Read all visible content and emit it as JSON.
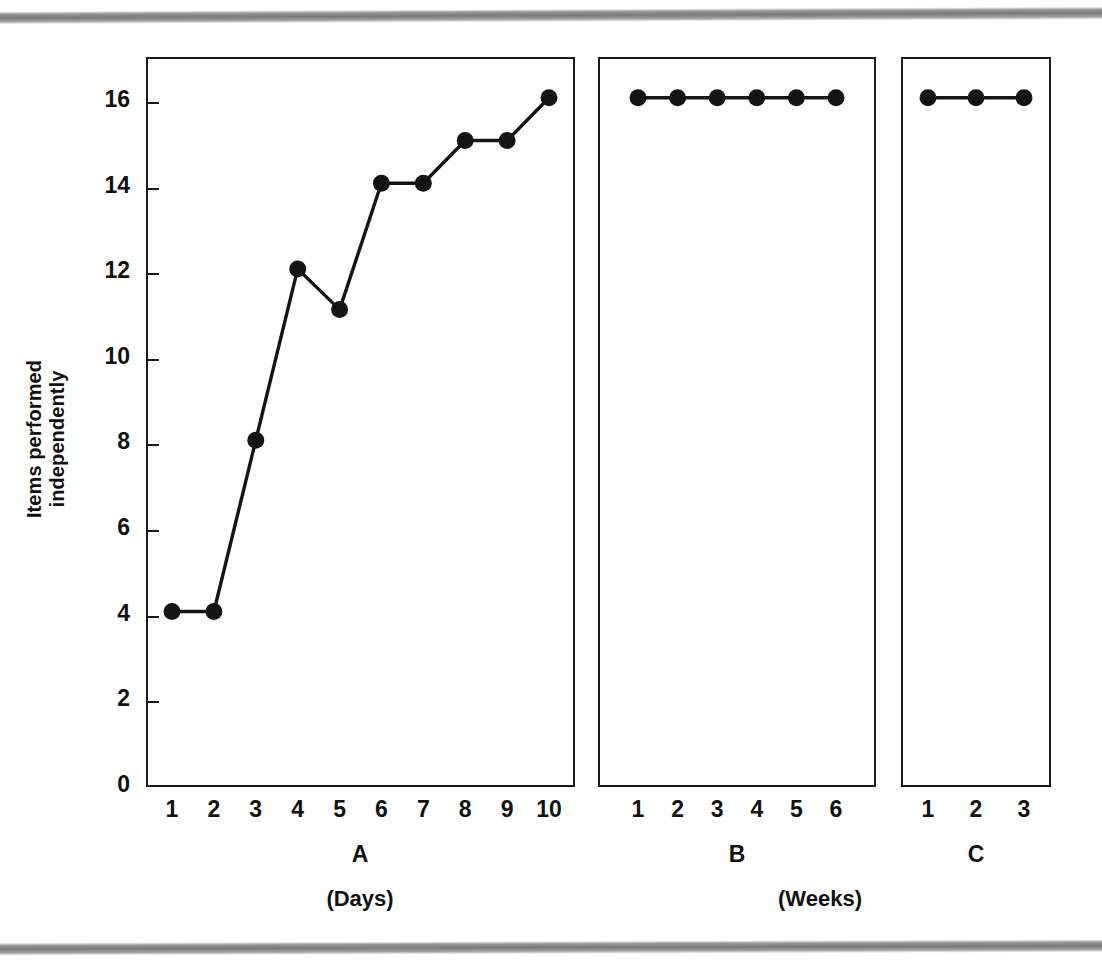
{
  "figure": {
    "background": "#ffffff",
    "ink_color": "#141414"
  },
  "axis": {
    "y_title": "Items performed independently",
    "y_ticks": [
      "0",
      "2",
      "4",
      "6",
      "8",
      "10",
      "12",
      "14",
      "16"
    ]
  },
  "panels": {
    "a": {
      "letter": "A",
      "unit": "(Days)",
      "x_ticks": [
        "1",
        "2",
        "3",
        "4",
        "5",
        "6",
        "7",
        "8",
        "9",
        "10"
      ]
    },
    "b": {
      "letter": "B",
      "unit": "(Weeks)",
      "x_ticks": [
        "1",
        "2",
        "3",
        "4",
        "5",
        "6"
      ]
    },
    "c": {
      "letter": "C",
      "unit": "",
      "x_ticks": [
        "1",
        "2",
        "3"
      ]
    }
  },
  "chart_data": {
    "type": "line",
    "title": "",
    "xlabel": "",
    "ylabel": "Items performed independently",
    "ylim": [
      0,
      17
    ],
    "grid": false,
    "legend": "none",
    "marker": "filled-circle",
    "panels": [
      {
        "name": "A",
        "unit": "(Days)",
        "x": [
          1,
          2,
          3,
          4,
          5,
          6,
          7,
          8,
          9,
          10
        ],
        "y": [
          4.1,
          4.1,
          8.1,
          12.1,
          11.15,
          14.1,
          14.1,
          15.1,
          15.1,
          16.1
        ]
      },
      {
        "name": "B",
        "unit": "(Weeks)",
        "x": [
          1,
          2,
          3,
          4,
          5,
          6
        ],
        "y": [
          16.1,
          16.1,
          16.1,
          16.1,
          16.1,
          16.1
        ]
      },
      {
        "name": "C",
        "unit": "(Weeks)",
        "x": [
          1,
          2,
          3
        ],
        "y": [
          16.1,
          16.1,
          16.1
        ]
      }
    ]
  }
}
